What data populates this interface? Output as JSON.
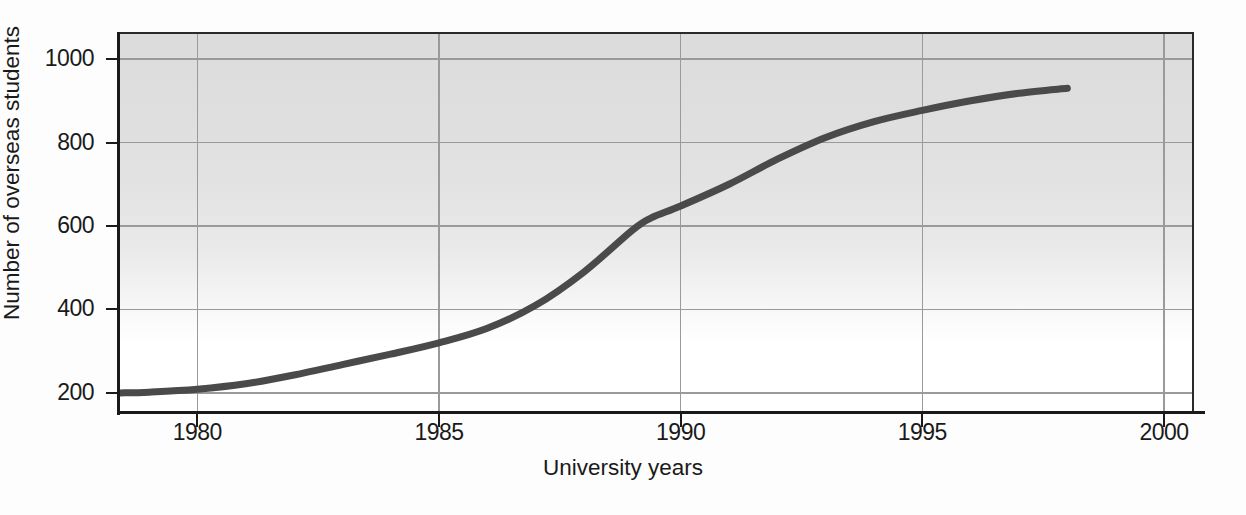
{
  "chart_data": {
    "type": "line",
    "title": "",
    "xlabel": "University years",
    "ylabel": "Number of overseas students",
    "xlim": [
      1978.4,
      2000.6
    ],
    "ylim": [
      152,
      1060
    ],
    "grid": true,
    "legend": null,
    "xticks": [
      1980,
      1985,
      1990,
      1995,
      2000
    ],
    "xtick_labels": [
      "1980",
      "1985",
      "1990",
      "1995",
      "2000"
    ],
    "yticks": [
      200,
      400,
      600,
      800,
      1000
    ],
    "ytick_labels": [
      "200",
      "400",
      "600",
      "800",
      "1000"
    ],
    "series": [
      {
        "name": "Number of overseas students",
        "color": "#4a4a4a",
        "line_width": 7,
        "x": [
          1978.4,
          1979,
          1980,
          1981,
          1982,
          1983,
          1984,
          1985,
          1986,
          1987,
          1988,
          1989,
          1989.4,
          1990,
          1991,
          1992,
          1993,
          1994,
          1995,
          1996,
          1997,
          1998
        ],
        "y": [
          200,
          202,
          209,
          222,
          243,
          268,
          293,
          320,
          355,
          410,
          490,
          590,
          620,
          648,
          700,
          760,
          812,
          850,
          877,
          900,
          918,
          930
        ]
      }
    ],
    "axis_color": "#1a1a1a",
    "grid_color": "#9a9a9a",
    "plot_bg_top": "#dcdcdc",
    "plot_bg_bottom": "#ffffff"
  },
  "axes": {
    "y_title": "Number of overseas students",
    "x_title": "University years"
  }
}
